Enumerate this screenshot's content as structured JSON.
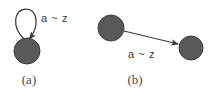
{
  "figure": {
    "background_color": "#ffffff",
    "node_fill_color": "#595959",
    "node_stroke_color": "#3f3f3f",
    "edge_color": "#3a3a3a",
    "text_color": "#3a3a3a",
    "caption_color": "#4a4a4a",
    "panels": [
      {
        "id": "panel-a",
        "caption": "(a)",
        "caption_x": 29,
        "caption_y": 84,
        "description": "self-loop on a single node",
        "nodes": [
          {
            "id": "a-node",
            "cx": 27,
            "cy": 51,
            "r": 13
          }
        ],
        "edges": [
          {
            "id": "a-self-loop",
            "from": "a-node",
            "to": "a-node",
            "type": "self-loop",
            "label": "a ~ z",
            "label_x": 41,
            "label_y": 22
          }
        ]
      },
      {
        "id": "panel-b",
        "caption": "(b)",
        "caption_x": 135,
        "caption_y": 84,
        "description": "directed edge between two nodes",
        "nodes": [
          {
            "id": "b-node-left",
            "cx": 111,
            "cy": 28,
            "r": 13
          },
          {
            "id": "b-node-right",
            "cx": 191,
            "cy": 48,
            "r": 12
          }
        ],
        "edges": [
          {
            "id": "b-arrow",
            "from": "b-node-left",
            "to": "b-node-right",
            "type": "arrow",
            "label": "a ~ z",
            "label_x": 128,
            "label_y": 58,
            "x1": 124,
            "y1": 31,
            "x2": 178,
            "y2": 44
          }
        ]
      }
    ]
  }
}
